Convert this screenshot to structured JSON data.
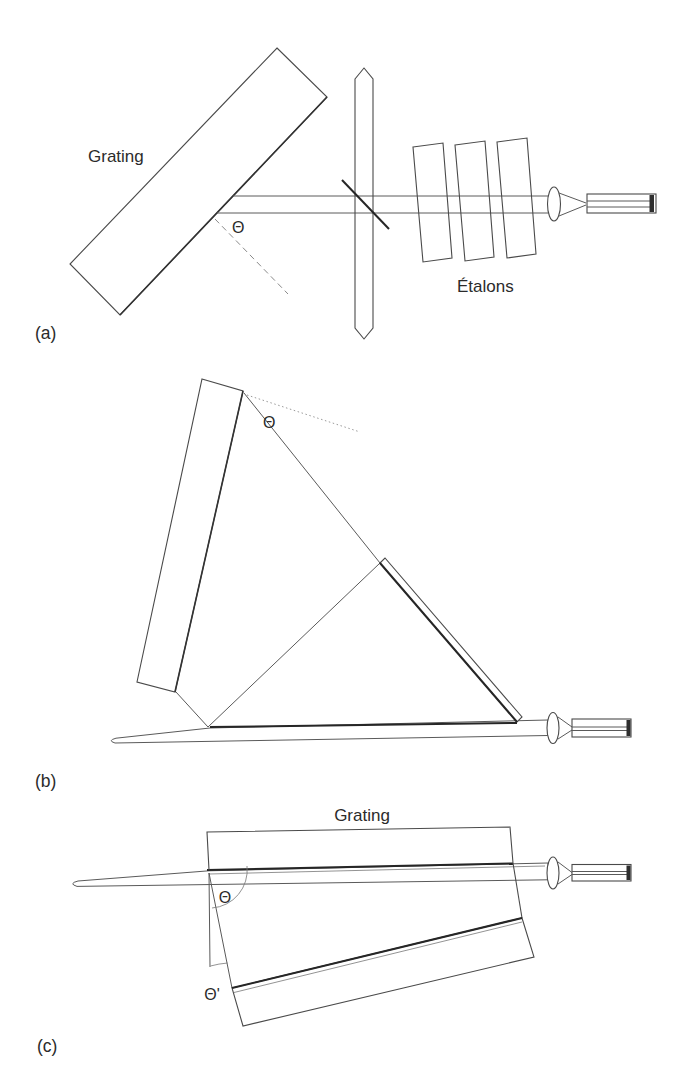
{
  "figure": {
    "background_color": "#ffffff",
    "line_color": "#4a4a4a",
    "dark_line_color": "#262626",
    "muted_line_color": "#9a9a9a",
    "text_color": "#2b2b2b",
    "panels": {
      "a": {
        "tag": "(a)",
        "grating_label": "Grating",
        "etalons_label": "Étalons",
        "angle_label": "Θ"
      },
      "b": {
        "tag": "(b)",
        "angle_label": "Θ"
      },
      "c": {
        "tag": "(c)",
        "grating_label": "Grating",
        "angle_label": "Θ",
        "angle_prime_label": "Θ'"
      }
    }
  }
}
